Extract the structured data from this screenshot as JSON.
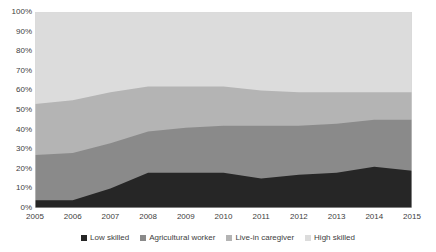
{
  "chart_data": {
    "type": "area",
    "stacked": true,
    "normalized": "100%",
    "title": "",
    "subtitle": "",
    "xlabel": "",
    "ylabel": "",
    "categories": [
      "2005",
      "2006",
      "2007",
      "2008",
      "2009",
      "2010",
      "2011",
      "2012",
      "2013",
      "2014",
      "2015"
    ],
    "x": [
      2005,
      2006,
      2007,
      2008,
      2009,
      2010,
      2011,
      2012,
      2013,
      2014,
      2015
    ],
    "ylim": [
      0,
      100
    ],
    "ytick_labels": [
      "0%",
      "10%",
      "20%",
      "30%",
      "40%",
      "50%",
      "60%",
      "70%",
      "80%",
      "90%",
      "100%"
    ],
    "ytick_values": [
      0,
      10,
      20,
      30,
      40,
      50,
      60,
      70,
      80,
      90,
      100
    ],
    "grid": false,
    "legend_position": "bottom",
    "series": [
      {
        "name": "Low skilled",
        "color": "#262626",
        "values": [
          4,
          4,
          10,
          18,
          18,
          18,
          15,
          17,
          18,
          21,
          19
        ]
      },
      {
        "name": "Agricultural worker",
        "color": "#8A8A8A",
        "values": [
          23,
          24,
          23,
          21,
          23,
          24,
          27,
          25,
          25,
          24,
          26
        ]
      },
      {
        "name": "Live-in caregiver",
        "color": "#B4B4B4",
        "values": [
          26,
          27,
          26,
          23,
          21,
          20,
          18,
          17,
          16,
          14,
          14
        ]
      },
      {
        "name": "High skilled",
        "color": "#DCDCDC",
        "values": [
          47,
          45,
          41,
          38,
          38,
          38,
          40,
          41,
          41,
          41,
          41
        ]
      }
    ],
    "cumulative_boundaries": {
      "low_skilled_top": [
        4,
        4,
        10,
        18,
        18,
        18,
        15,
        17,
        18,
        21,
        19
      ],
      "agricultural_top": [
        27,
        28,
        33,
        39,
        41,
        42,
        42,
        42,
        43,
        45,
        45
      ],
      "caregiver_top": [
        53,
        55,
        59,
        62,
        62,
        62,
        60,
        59,
        59,
        59,
        59
      ],
      "high_skilled_top": [
        100,
        100,
        100,
        100,
        100,
        100,
        100,
        100,
        100,
        100,
        100
      ]
    }
  },
  "legend": {
    "items": [
      {
        "label": "Low skilled",
        "color": "#262626"
      },
      {
        "label": "Agricultural worker",
        "color": "#8A8A8A"
      },
      {
        "label": "Live-in caregiver",
        "color": "#B4B4B4"
      },
      {
        "label": "High skilled",
        "color": "#DCDCDC"
      }
    ]
  }
}
